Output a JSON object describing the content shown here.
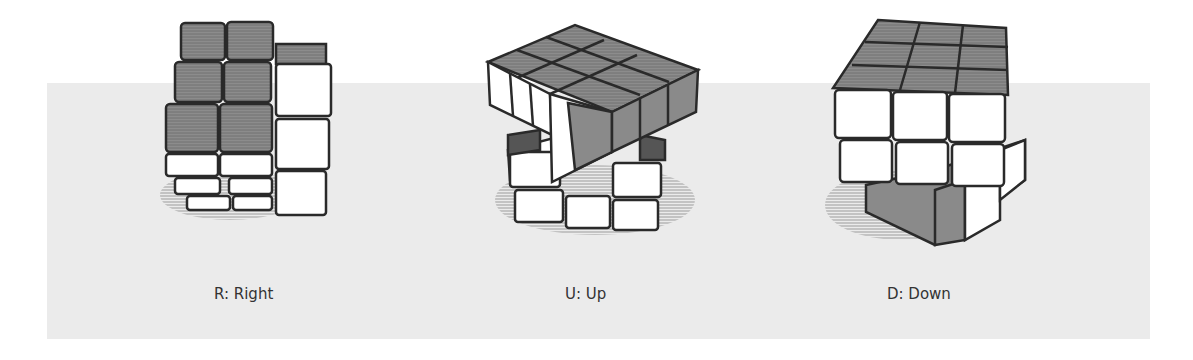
{
  "figures": [
    {
      "id": "R",
      "label": "R: Right",
      "move": "R",
      "name": "Right"
    },
    {
      "id": "U",
      "label": "U: Up",
      "move": "U",
      "name": "Up"
    },
    {
      "id": "D",
      "label": "D: Down",
      "move": "D",
      "name": "Down"
    }
  ],
  "colors": {
    "background": "#ffffff",
    "band": "#ebebeb",
    "top_face": "#8a8a8a",
    "side_face": "#ffffff",
    "outline": "#2a2a2a",
    "label_text": "#333333"
  }
}
